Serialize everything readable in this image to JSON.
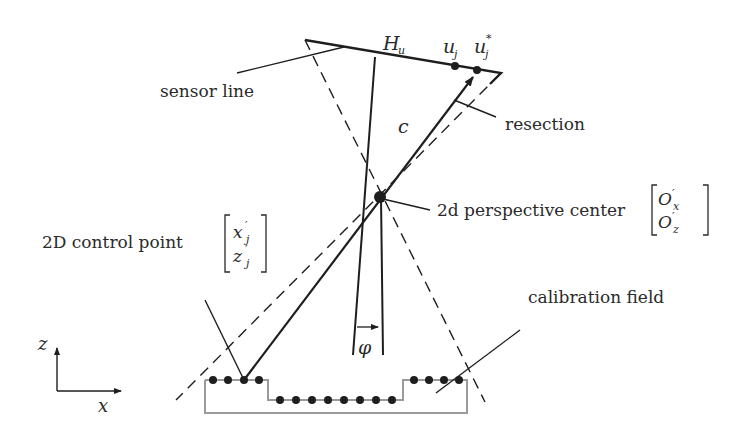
{
  "diagram": {
    "type": "camera resection geometry (2D line sensor)",
    "labels": {
      "sensor_line": "sensor line",
      "resection": "resection",
      "perspective_center": "2d perspective center",
      "control_point": "2D control point",
      "calibration_field": "calibration field"
    },
    "math": {
      "principal_point": {
        "base": "H",
        "sub": "u"
      },
      "image_point": {
        "base": "u",
        "sub": "j"
      },
      "image_point_star": {
        "base": "u",
        "sub": "j",
        "sup": "*"
      },
      "focal_length": "c",
      "angle": "φ",
      "center_vector": [
        {
          "base": "O",
          "sup": "′",
          "sub": "x"
        },
        {
          "base": "O",
          "sup": "′",
          "sub": "z"
        }
      ],
      "control_vector": [
        {
          "base": "x",
          "sup": "′",
          "sub": "j"
        },
        {
          "base": "z",
          "sup": "′",
          "sub": "j"
        }
      ],
      "axis_x": "x",
      "axis_z": "z"
    },
    "calibration_points": {
      "left_step": 4,
      "middle_low": 8,
      "right_step": 4
    },
    "colors": {
      "ink": "#1e1e1e",
      "field_outline": "#9a9a9a"
    }
  }
}
